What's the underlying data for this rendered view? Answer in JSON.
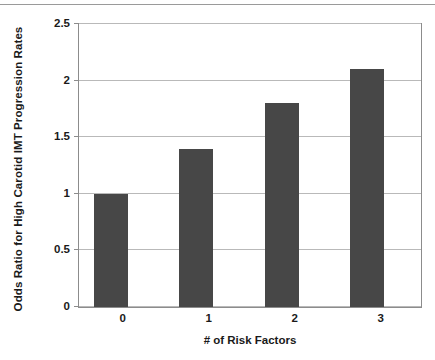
{
  "chart_data": {
    "type": "bar",
    "title": "",
    "categories": [
      "0",
      "1",
      "2",
      "3"
    ],
    "values": [
      1.0,
      1.4,
      1.8,
      2.1
    ],
    "series": [
      {
        "name": "Odds Ratio for High Carotid IMT Progression Rates",
        "values": [
          1.0,
          1.4,
          1.8,
          2.1
        ]
      }
    ],
    "xlabel": "# of Risk Factors",
    "ylabel": "Odds Ratio for High Carotid IMT Progression Rates",
    "ylim": [
      0,
      2.5
    ],
    "yticks": [
      "0",
      "0.5",
      "1",
      "1.5",
      "2",
      "2.5"
    ],
    "ytick_values": [
      0,
      0.5,
      1,
      1.5,
      2,
      2.5
    ],
    "grid": true,
    "legend": "none",
    "bar_color": "#474747",
    "gridline_color": "#b9b9b9",
    "frame_color": "#8c8c8c",
    "background_color": "#ffffff"
  }
}
